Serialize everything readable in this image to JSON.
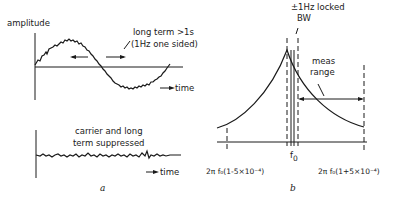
{
  "panel_a": {
    "label": "a",
    "top": {
      "y_axis_label": "amplitude",
      "annotation_line1": "long term >1s",
      "annotation_line2": "(1Hz one sided)",
      "x_axis_label": "time"
    },
    "bottom": {
      "annotation_line1": "carrier and long",
      "annotation_line2": "term suppressed",
      "x_axis_label": "time"
    }
  },
  "panel_b": {
    "label": "b",
    "bw_label_line1": "±1Hz locked",
    "bw_label_line2": "BW",
    "range_label_line1": "meas",
    "range_label_line2": "range",
    "center_label": "f",
    "center_sub": "0",
    "left_tick_label": "2π f₀(1-5×10⁻⁴)",
    "right_tick_label": "2π f₀(1+5×10⁻⁴)"
  },
  "colors": {
    "ink": "#1a1a1a",
    "background": "#ffffff"
  }
}
